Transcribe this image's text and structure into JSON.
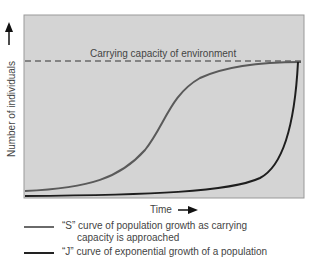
{
  "figure": {
    "background_color": "#d4d4d4",
    "y_axis_label": "Number of individuals",
    "x_axis_label": "Time",
    "carrying_capacity_label": "Carrying capacity of environment",
    "s_curve_color": "#6a6a6a",
    "j_curve_color": "#222222"
  },
  "legend": {
    "items": [
      {
        "label_line1": "“S” curve of population growth as carrying",
        "label_line2": "capacity is approached",
        "color": "#6a6a6a"
      },
      {
        "label_line1": "“J” curve of exponential growth of a population",
        "color": "#222222"
      }
    ]
  }
}
